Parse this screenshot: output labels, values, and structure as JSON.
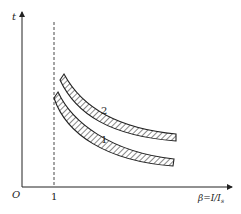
{
  "axes": {
    "y_label": "t",
    "x_label": "β=I/I",
    "x_label_sub": "s",
    "origin_label": "O",
    "x_tick": "1"
  },
  "curves": [
    {
      "label": "1"
    },
    {
      "label": "2"
    }
  ],
  "colors": {
    "ink": "#222222",
    "background": "#ffffff"
  }
}
